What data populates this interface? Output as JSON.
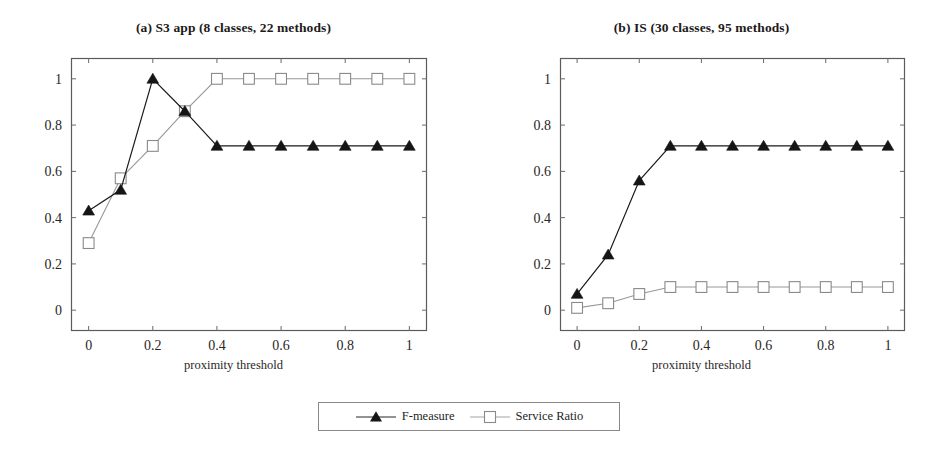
{
  "figure": {
    "xlabel": "proximity threshold",
    "legend_position": "bottom-center"
  },
  "legend": {
    "entries": [
      {
        "label": "F-measure",
        "marker": "filled-triangle",
        "color": "#1a1a1a"
      },
      {
        "label": "Service Ratio",
        "marker": "open-square",
        "color": "#9a9696"
      }
    ]
  },
  "panels": [
    {
      "title": "(a) S3 app (8 classes, 22 methods)",
      "xlabel": "proximity threshold"
    },
    {
      "title": "(b) IS (30 classes, 95 methods)",
      "xlabel": "proximity threshold"
    }
  ],
  "chart_data": [
    {
      "type": "line",
      "title": "(a) S3 app (8 classes, 22 methods)",
      "xlabel": "proximity threshold",
      "ylabel": "",
      "x": [
        0,
        0.1,
        0.2,
        0.3,
        0.4,
        0.5,
        0.6,
        0.7,
        0.8,
        0.9,
        1
      ],
      "xticks": [
        0,
        0.2,
        0.4,
        0.6,
        0.8,
        1
      ],
      "xticklabels": [
        "0",
        "0.2",
        "0.4",
        "0.6",
        "0.8",
        "1"
      ],
      "yticks": [
        0,
        0.2,
        0.4,
        0.6,
        0.8,
        1
      ],
      "yticklabels": [
        "0",
        "0.2",
        "0.4",
        "0.6",
        "0.8",
        "1"
      ],
      "xlim": [
        -0.055,
        1.055
      ],
      "ylim": [
        -0.09,
        1.09
      ],
      "grid": false,
      "series": [
        {
          "name": "F-measure",
          "marker": "filled-triangle",
          "color": "#1a1a1a",
          "values": [
            0.43,
            0.52,
            1.0,
            0.86,
            0.71,
            0.71,
            0.71,
            0.71,
            0.71,
            0.71,
            0.71
          ]
        },
        {
          "name": "Service Ratio",
          "marker": "open-square",
          "color": "#9a9696",
          "values": [
            0.29,
            0.57,
            0.71,
            0.86,
            1.0,
            1.0,
            1.0,
            1.0,
            1.0,
            1.0,
            1.0
          ]
        }
      ]
    },
    {
      "type": "line",
      "title": "(b) IS (30 classes, 95 methods)",
      "xlabel": "proximity threshold",
      "ylabel": "",
      "x": [
        0,
        0.1,
        0.2,
        0.3,
        0.4,
        0.5,
        0.6,
        0.7,
        0.8,
        0.9,
        1
      ],
      "xticks": [
        0,
        0.2,
        0.4,
        0.6,
        0.8,
        1
      ],
      "xticklabels": [
        "0",
        "0.2",
        "0.4",
        "0.6",
        "0.8",
        "1"
      ],
      "yticks": [
        0,
        0.2,
        0.4,
        0.6,
        0.8,
        1
      ],
      "yticklabels": [
        "0",
        "0.2",
        "0.4",
        "0.6",
        "0.8",
        "1"
      ],
      "xlim": [
        -0.055,
        1.055
      ],
      "ylim": [
        -0.09,
        1.09
      ],
      "grid": false,
      "series": [
        {
          "name": "F-measure",
          "marker": "filled-triangle",
          "color": "#1a1a1a",
          "values": [
            0.07,
            0.24,
            0.56,
            0.71,
            0.71,
            0.71,
            0.71,
            0.71,
            0.71,
            0.71,
            0.71
          ]
        },
        {
          "name": "Service Ratio",
          "marker": "open-square",
          "color": "#9a9696",
          "values": [
            0.01,
            0.03,
            0.07,
            0.1,
            0.1,
            0.1,
            0.1,
            0.1,
            0.1,
            0.1,
            0.1
          ]
        }
      ]
    }
  ]
}
